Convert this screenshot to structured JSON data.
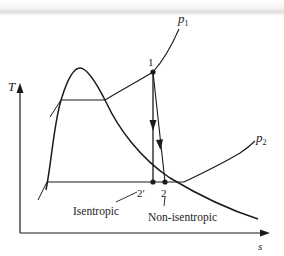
{
  "diagram": {
    "type": "T-s diagram",
    "axes": {
      "y_label": "T",
      "x_label": "s"
    },
    "pressure_lines": [
      {
        "label": "p",
        "subscript": "1"
      },
      {
        "label": "p",
        "subscript": "2"
      }
    ],
    "states": [
      {
        "id": "1",
        "label": "1"
      },
      {
        "id": "2s",
        "label": "2′"
      },
      {
        "id": "2",
        "label": "2"
      }
    ],
    "annotations": [
      {
        "text": "Isentropic",
        "points_to": "2′"
      },
      {
        "text": "Non-isentropic",
        "points_to": "2"
      }
    ],
    "colors": {
      "line": "#1a1a1a",
      "background": "#ffffff"
    }
  }
}
